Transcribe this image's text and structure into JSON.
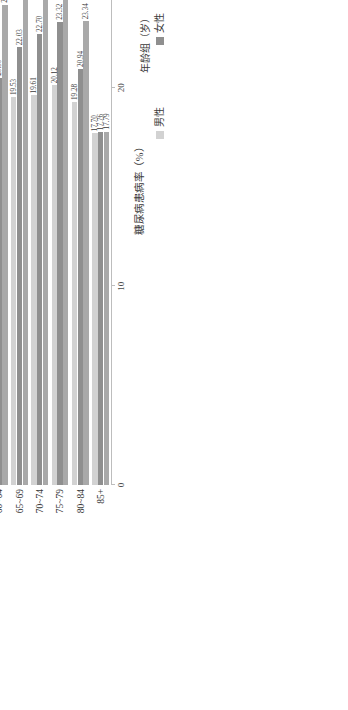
{
  "chart_data": {
    "type": "bar",
    "orientation": "horizontal",
    "title": "",
    "xlabel": "糖尿病患病率（%）",
    "ylabel": "年龄组（岁）",
    "xlim": [
      0,
      30
    ],
    "xticks": [
      "0",
      "10",
      "20",
      "30"
    ],
    "grid": false,
    "legend_position": "bottom-right",
    "categories": [
      "18~24",
      "25~29",
      "30~34",
      "35~39",
      "40~44",
      "45~49",
      "50~54",
      "55~59",
      "60~64",
      "65~69",
      "70~74",
      "75~79",
      "80~84",
      "85+"
    ],
    "series": [
      {
        "name": "男性",
        "color": "#d2d2d2",
        "values": [
          2.78,
          3.58,
          3.73,
          5.41,
          8.62,
          8.62,
          15.65,
          18.55,
          18.58,
          19.53,
          19.61,
          20.12,
          19.28,
          17.7
        ],
        "labels": [
          "2.78",
          "3.58",
          "3.73",
          "5.41",
          "8.62",
          "8.62",
          "15.65",
          "18.55",
          "18.58",
          "19.53",
          "19.61",
          "20.12",
          "19.28",
          "17.70"
        ]
      },
      {
        "name": "女性",
        "color": "#8f8f8f",
        "values": [
          3.18,
          4.33,
          5.73,
          8.18,
          10.65,
          11.06,
          16.45,
          19.28,
          20.5,
          22.03,
          22.7,
          23.32,
          20.94,
          17.76
        ],
        "labels": [
          "3.18",
          "4.33",
          "5.73",
          "8.18",
          "10.65",
          "11.06",
          "16.45",
          "19.28",
          "20.50",
          "22.03",
          "22.70",
          "23.32",
          "20.94",
          "17.76"
        ]
      },
      {
        "name": "合计",
        "color": "#a9a9a9",
        "values": [
          3.84,
          4.86,
          6.88,
          9.46,
          11.43,
          12.09,
          16.81,
          20.8,
          24.17,
          26.39,
          27.59,
          28.22,
          23.34,
          17.79
        ],
        "labels": [
          "3.84",
          "4.86",
          "6.88",
          "9.46",
          "11.43",
          "12.09",
          "16.81",
          "20.80",
          "24.17",
          "26.39",
          "27.59",
          "28.22",
          "23.34",
          "17.79"
        ]
      }
    ]
  },
  "legend": {
    "items": [
      {
        "label": "男性",
        "swatch": "sw-male"
      },
      {
        "label": "女性",
        "swatch": "sw-female"
      },
      {
        "label": "合计",
        "swatch": "sw-total"
      }
    ]
  }
}
